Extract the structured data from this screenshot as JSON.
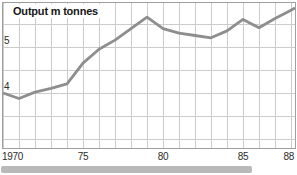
{
  "page": {
    "background": "#ffffff"
  },
  "colors": {
    "line": "#8e8e8e",
    "grid": "#cccccc",
    "frame": "#9f9f9f",
    "title_text": "#161616",
    "tick_text": "#2b2b2b",
    "bottom_strip": "#b9b9b9"
  },
  "chart_data": {
    "type": "line",
    "title": "Output m tonnes",
    "xlabel": "Year",
    "ylabel": "Output m tonnes",
    "x": [
      1970,
      1971,
      1972,
      1973,
      1974,
      1975,
      1976,
      1977,
      1978,
      1979,
      1980,
      1981,
      1982,
      1983,
      1984,
      1985,
      1986,
      1987,
      1988
    ],
    "series": [
      {
        "name": "Output",
        "values": [
          4.0,
          3.88,
          4.02,
          4.1,
          4.2,
          4.65,
          4.95,
          5.15,
          5.4,
          5.65,
          5.4,
          5.3,
          5.25,
          5.2,
          5.35,
          5.6,
          5.42,
          5.62,
          5.8
        ]
      }
    ],
    "xlim": [
      1970,
      1988
    ],
    "ylim": [
      2.8,
      6.0
    ],
    "grid": "on",
    "legend": "none",
    "x_gridline_step_years": 1,
    "y_gridlines": [
      5.5,
      5.0,
      4.5,
      4.0,
      3.5,
      3.0
    ],
    "x_ticks": [
      {
        "label": "1970",
        "year": 1970,
        "align": "left"
      },
      {
        "label": "75",
        "year": 1975,
        "align": "center"
      },
      {
        "label": "80",
        "year": 1980,
        "align": "center"
      },
      {
        "label": "85",
        "year": 1985,
        "align": "center"
      },
      {
        "label": "88",
        "year": 1988,
        "align": "right"
      }
    ],
    "y_ticks": [
      {
        "label": "5",
        "value": 5
      },
      {
        "label": "4",
        "value": 4
      }
    ]
  }
}
